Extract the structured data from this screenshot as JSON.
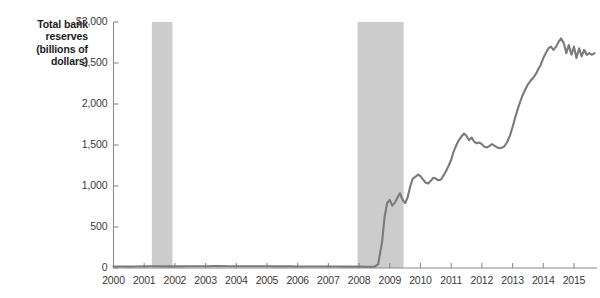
{
  "chart_data": {
    "type": "line",
    "title": "Total bank reserves (billions of dollars)",
    "title_lines": [
      "Total bank",
      "reserves",
      "(billions of",
      "dollars)"
    ],
    "xlabel": "",
    "ylabel": "Total bank reserves (billions of dollars)",
    "xlim": [
      2000,
      2015.75
    ],
    "ylim": [
      0,
      3000
    ],
    "grid": false,
    "legend": "none",
    "line_color": "#7a7a7a",
    "band_color": "#cccccc",
    "axis_color": "#8c8c8c",
    "ytick_values": [
      0,
      500,
      1000,
      1500,
      2000,
      2500,
      3000
    ],
    "ytick_labels": [
      "0",
      "500",
      "1,000",
      "1,500",
      "2,000",
      "2,500",
      "$3,000"
    ],
    "xtick_values": [
      2000,
      2001,
      2002,
      2003,
      2004,
      2005,
      2006,
      2007,
      2008,
      2009,
      2010,
      2011,
      2012,
      2013,
      2014,
      2015
    ],
    "xtick_labels": [
      "2000",
      "2001",
      "2002",
      "2003",
      "2004",
      "2005",
      "2006",
      "2007",
      "2008",
      "2009",
      "2010",
      "2011",
      "2012",
      "2013",
      "2014",
      "2015"
    ],
    "recession_bands": [
      {
        "name": "recession-2001",
        "start": 2001.25,
        "end": 2001.92
      },
      {
        "name": "recession-2008",
        "start": 2007.95,
        "end": 2009.45
      }
    ],
    "series": [
      {
        "name": "Total bank reserves",
        "x": [
          2000.0,
          2000.25,
          2000.5,
          2000.75,
          2001.0,
          2001.25,
          2001.5,
          2001.75,
          2002.0,
          2002.25,
          2002.5,
          2002.75,
          2003.0,
          2003.25,
          2003.5,
          2003.75,
          2004.0,
          2004.25,
          2004.5,
          2004.75,
          2005.0,
          2005.25,
          2005.5,
          2005.75,
          2006.0,
          2006.25,
          2006.5,
          2006.75,
          2007.0,
          2007.25,
          2007.5,
          2007.75,
          2008.0,
          2008.25,
          2008.5,
          2008.62,
          2008.75,
          2008.83,
          2008.92,
          2009.0,
          2009.08,
          2009.17,
          2009.25,
          2009.33,
          2009.42,
          2009.5,
          2009.58,
          2009.67,
          2009.75,
          2009.83,
          2009.92,
          2010.0,
          2010.08,
          2010.17,
          2010.25,
          2010.33,
          2010.42,
          2010.5,
          2010.58,
          2010.67,
          2010.75,
          2010.83,
          2010.92,
          2011.0,
          2011.08,
          2011.17,
          2011.25,
          2011.33,
          2011.42,
          2011.5,
          2011.58,
          2011.67,
          2011.75,
          2011.83,
          2011.92,
          2012.0,
          2012.08,
          2012.17,
          2012.25,
          2012.33,
          2012.42,
          2012.5,
          2012.58,
          2012.67,
          2012.75,
          2012.83,
          2012.92,
          2013.0,
          2013.08,
          2013.17,
          2013.25,
          2013.33,
          2013.42,
          2013.5,
          2013.58,
          2013.67,
          2013.75,
          2013.83,
          2013.92,
          2014.0,
          2014.08,
          2014.17,
          2014.25,
          2014.33,
          2014.42,
          2014.5,
          2014.58,
          2014.67,
          2014.75,
          2014.83,
          2014.92,
          2015.0,
          2015.08,
          2015.17,
          2015.25,
          2015.33,
          2015.42,
          2015.5,
          2015.58,
          2015.67
        ],
        "values": [
          18,
          18,
          17,
          19,
          20,
          22,
          21,
          20,
          20,
          20,
          21,
          22,
          22,
          23,
          23,
          22,
          22,
          22,
          21,
          21,
          21,
          20,
          20,
          20,
          19,
          19,
          19,
          19,
          18,
          18,
          17,
          17,
          17,
          16,
          16,
          45,
          320,
          620,
          800,
          830,
          760,
          800,
          860,
          910,
          830,
          790,
          860,
          1000,
          1090,
          1110,
          1140,
          1120,
          1080,
          1040,
          1030,
          1060,
          1100,
          1090,
          1070,
          1080,
          1130,
          1180,
          1250,
          1320,
          1420,
          1500,
          1560,
          1600,
          1640,
          1610,
          1560,
          1590,
          1540,
          1520,
          1530,
          1510,
          1480,
          1470,
          1490,
          1510,
          1490,
          1470,
          1460,
          1470,
          1490,
          1540,
          1620,
          1720,
          1830,
          1940,
          2030,
          2110,
          2180,
          2240,
          2280,
          2320,
          2360,
          2420,
          2480,
          2560,
          2620,
          2680,
          2700,
          2660,
          2700,
          2760,
          2800,
          2740,
          2620,
          2720,
          2600,
          2700,
          2560,
          2680,
          2580,
          2660,
          2600,
          2620,
          2600,
          2620
        ]
      }
    ]
  }
}
